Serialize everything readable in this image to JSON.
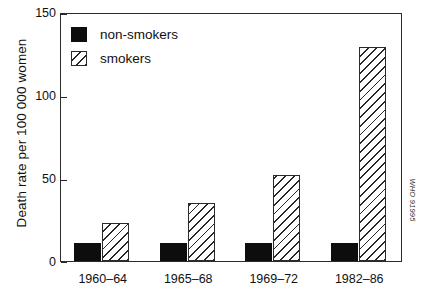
{
  "chart_data": {
    "type": "bar",
    "title": "",
    "subtitle": "",
    "xlabel": "",
    "ylabel": "Death rate per 100 000 women",
    "categories": [
      "1960–64",
      "1965–68",
      "1969–72",
      "1982–86"
    ],
    "series": [
      {
        "name": "non-smokers",
        "values": [
          11,
          11,
          11,
          11
        ],
        "fill": "solid-black",
        "color": "#0d0d0d"
      },
      {
        "name": "smokers",
        "values": [
          23,
          35,
          52,
          129
        ],
        "fill": "diagonal-hatch",
        "color": "#262626"
      }
    ],
    "ylim": [
      0,
      150
    ],
    "yticks": [
      0,
      50,
      100,
      150
    ],
    "ytick_labels": [
      "0",
      "50",
      "100",
      "150"
    ],
    "grid": false,
    "legend_position": "top-left",
    "frame": "full-box",
    "annotations": [
      {
        "name": "source-credit",
        "text": "WHO 91995",
        "position": "right-margin",
        "rotation": 90
      }
    ]
  },
  "legend": {
    "items": [
      {
        "label": "non-smokers",
        "swatch": "solid-black-square"
      },
      {
        "label": "smokers",
        "swatch": "hatched-square"
      }
    ]
  },
  "axes": {
    "y": {
      "title": "Death rate per 100 000 women",
      "ticks": [
        "150",
        "100",
        "50",
        "0"
      ]
    },
    "x": {
      "ticks": [
        "1960–64",
        "1965–68",
        "1969–72",
        "1982–86"
      ]
    }
  },
  "credit": {
    "text": "WHO 91995"
  },
  "colors": {
    "nonsmoker": "#0d0d0d",
    "smoker_hatch": "#262626",
    "axis": "#2b2b2b",
    "background": "#ffffff"
  }
}
